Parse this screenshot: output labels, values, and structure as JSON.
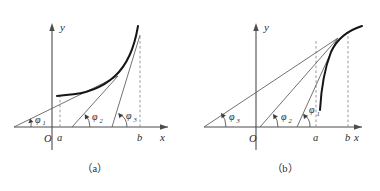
{
  "figure": {
    "panels": [
      {
        "id": "a",
        "caption": "（a）",
        "axes": {
          "x_label": "x",
          "y_label": "y",
          "origin_label": "O"
        },
        "point_labels": {
          "a": "a",
          "b": "b"
        },
        "angles": [
          {
            "name": "phi1",
            "label": "φ",
            "subscript": "1"
          },
          {
            "name": "phi2",
            "label": "φ",
            "subscript": "2"
          },
          {
            "name": "phi3",
            "label": "φ",
            "subscript": "3"
          }
        ],
        "curve_description": "convex increasing curve from x=a to x=b"
      },
      {
        "id": "b",
        "caption": "（b）",
        "axes": {
          "x_label": "x",
          "y_label": "y",
          "origin_label": "O"
        },
        "point_labels": {
          "a": "a",
          "b": "b"
        },
        "angles": [
          {
            "name": "phi3",
            "label": "φ",
            "subscript": "3"
          },
          {
            "name": "phi2",
            "label": "φ",
            "subscript": "2"
          },
          {
            "name": "phi1",
            "label": "φ",
            "subscript": "1"
          }
        ],
        "curve_description": "concave increasing curve from x=a rising then flattening past x=b"
      }
    ],
    "colors": {
      "curve": "#151515",
      "axis": "#4d4d4d",
      "ray": "#595959",
      "dashed": "#8c8c8c",
      "background": "#ffffff"
    }
  }
}
